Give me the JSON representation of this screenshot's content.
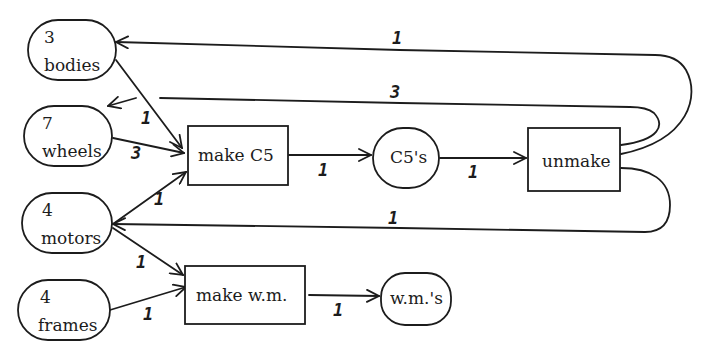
{
  "diagram": {
    "type": "petri-net",
    "places": {
      "bodies": {
        "count": "3",
        "label": "bodies"
      },
      "wheels": {
        "count": "7",
        "label": "wheels"
      },
      "motors": {
        "count": "4",
        "label": "motors"
      },
      "frames": {
        "count": "4",
        "label": "frames"
      },
      "c5s": {
        "label": "C5's"
      },
      "wms": {
        "label": "w.m.'s"
      }
    },
    "transitions": {
      "make_c5": {
        "label": "make C5"
      },
      "unmake": {
        "label": "unmake"
      },
      "make_wm": {
        "label": "make w.m."
      }
    },
    "edges": [
      {
        "from": "bodies",
        "to": "make C5",
        "weight": "1"
      },
      {
        "from": "wheels",
        "to": "make C5",
        "weight": "3"
      },
      {
        "from": "motors",
        "to": "make C5",
        "weight": "1"
      },
      {
        "from": "make C5",
        "to": "C5's",
        "weight": "1"
      },
      {
        "from": "C5's",
        "to": "unmake",
        "weight": "1"
      },
      {
        "from": "unmake",
        "to": "bodies",
        "weight": "1"
      },
      {
        "from": "unmake",
        "to": "wheels",
        "weight": "3"
      },
      {
        "from": "unmake",
        "to": "motors",
        "weight": "1"
      },
      {
        "from": "motors",
        "to": "make w.m.",
        "weight": "1"
      },
      {
        "from": "frames",
        "to": "make w.m.",
        "weight": "1"
      },
      {
        "from": "make w.m.",
        "to": "w.m.'s",
        "weight": "1"
      }
    ],
    "weights": {
      "bodies_to_makec5": "1",
      "wheels_to_makec5": "3",
      "motors_to_makec5": "1",
      "makec5_to_c5s": "1",
      "c5s_to_unmake": "1",
      "unmake_to_bodies": "1",
      "unmake_to_wheels": "3",
      "unmake_to_motors": "1",
      "motors_to_makewm": "1",
      "frames_to_makewm": "1",
      "makewm_to_wms": "1"
    }
  }
}
